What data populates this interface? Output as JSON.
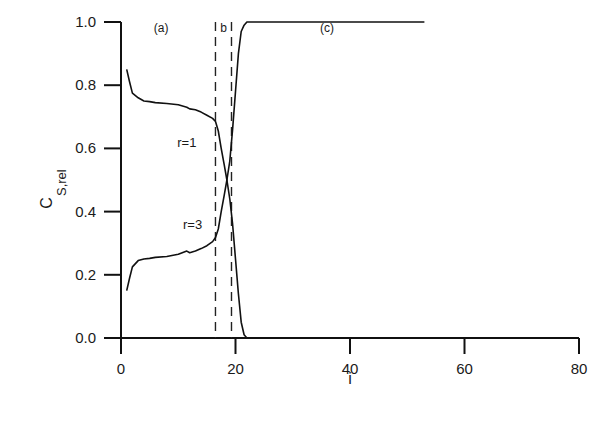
{
  "chart_data": {
    "type": "line",
    "title": "",
    "xlabel": "i",
    "ylabel": "C",
    "ylabel_subscript": "S,rel",
    "xlim": [
      0,
      80
    ],
    "ylim": [
      0.0,
      1.0
    ],
    "x_ticks": [
      "0",
      "20",
      "40",
      "60",
      "80"
    ],
    "y_ticks": [
      "0.0",
      "0.2",
      "0.4",
      "0.6",
      "0.8",
      "1.0"
    ],
    "grid": false,
    "legend": "none (inline curve labels)",
    "series": [
      {
        "name": "r=1",
        "label": "r=1",
        "x": [
          1,
          1.5,
          2,
          3,
          4,
          5,
          6,
          8,
          10,
          11.5,
          12,
          13,
          14,
          15,
          16,
          16.5,
          17,
          17.5,
          18,
          18.5,
          19,
          19.5,
          20,
          20.5,
          21,
          21.5,
          22,
          30,
          40,
          60,
          80
        ],
        "y": [
          0.85,
          0.81,
          0.775,
          0.76,
          0.75,
          0.748,
          0.745,
          0.742,
          0.738,
          0.73,
          0.725,
          0.722,
          0.715,
          0.705,
          0.695,
          0.685,
          0.655,
          0.6,
          0.55,
          0.5,
          0.44,
          0.36,
          0.25,
          0.14,
          0.05,
          0.01,
          0.0,
          0.0,
          0.0,
          0.0,
          0.0
        ]
      },
      {
        "name": "r=3",
        "label": "r=3",
        "x": [
          1,
          1.5,
          2,
          3,
          4,
          5,
          6,
          8,
          10,
          11.5,
          12,
          13,
          14,
          15,
          16,
          16.5,
          17,
          17.5,
          18,
          18.5,
          19,
          19.5,
          20,
          20.5,
          21,
          21.5,
          22,
          30,
          40,
          53
        ],
        "y": [
          0.15,
          0.19,
          0.225,
          0.245,
          0.25,
          0.252,
          0.255,
          0.258,
          0.265,
          0.275,
          0.27,
          0.275,
          0.283,
          0.292,
          0.305,
          0.318,
          0.345,
          0.4,
          0.45,
          0.5,
          0.56,
          0.66,
          0.78,
          0.9,
          0.97,
          0.99,
          1.0,
          1.0,
          1.0,
          1.0
        ]
      }
    ],
    "reference_lines": [
      {
        "type": "vertical",
        "style": "dashed",
        "x": 16.5
      },
      {
        "type": "vertical",
        "style": "dashed",
        "x": 19.3
      }
    ],
    "annotations": [
      {
        "text": "(a)",
        "x": 7,
        "y": 0.985
      },
      {
        "text": "b",
        "x": 17.9,
        "y": 0.985
      },
      {
        "text": "(c)",
        "x": 36,
        "y": 0.985
      },
      {
        "text": "r=1",
        "x": 11.5,
        "y": 0.62
      },
      {
        "text": "r=3",
        "x": 12.5,
        "y": 0.36
      }
    ]
  }
}
